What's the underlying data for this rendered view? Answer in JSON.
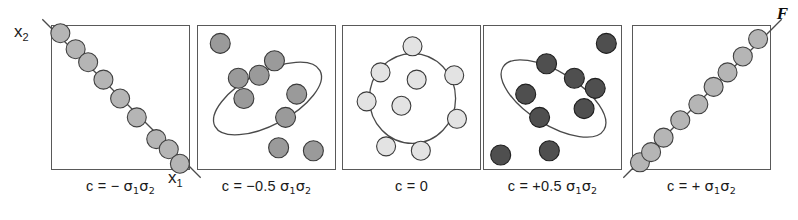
{
  "figure": {
    "tag": "F",
    "axis_x_label": "x",
    "axis_x_sub": "1",
    "axis_y_label": "x",
    "axis_y_sub": "2",
    "background_color": "#ffffff",
    "frame_color": "#595959"
  },
  "chart_data": {
    "type": "scatter",
    "title": "",
    "subtitle": "",
    "xlabel": "x1",
    "ylabel": "x2",
    "xlim": [
      0,
      1
    ],
    "ylim": [
      0,
      1
    ],
    "grid": false,
    "legend": null,
    "note": "Five scatter panels illustrating covariance c between two variables x1 and x2, from perfect negative correlation through zero to perfect positive correlation.",
    "panels": [
      {
        "id": "panel-neg-full",
        "caption": "c = − σ₁σ₂",
        "caption_parts": {
          "lhs": "c =",
          "sign": "−",
          "magnitude": "",
          "sigma": "σ₁σ₂"
        },
        "covariance": -1.0,
        "shape": "line",
        "shape_angle_deg": -45,
        "dot_fill": "#b5b5b5",
        "dot_stroke": "#404040",
        "dot_radius": 9.5,
        "points": [
          [
            0.06,
            0.95
          ],
          [
            0.17,
            0.84
          ],
          [
            0.26,
            0.75
          ],
          [
            0.37,
            0.63
          ],
          [
            0.49,
            0.5
          ],
          [
            0.61,
            0.37
          ],
          [
            0.75,
            0.22
          ],
          [
            0.84,
            0.15
          ],
          [
            0.92,
            0.05
          ]
        ]
      },
      {
        "id": "panel-neg-half",
        "caption": "c = − 0.5 σ₁σ₂",
        "caption_parts": {
          "lhs": "c =",
          "sign": "−",
          "magnitude": "0.5",
          "sigma": "σ₁σ₂"
        },
        "covariance": -0.5,
        "shape": "ellipse",
        "shape_angle_deg": -62,
        "ellipse_rx": 0.19,
        "ellipse_ry": 0.41,
        "dot_fill": "#9a9a9a",
        "dot_stroke": "#3a3a3a",
        "dot_radius": 10,
        "points": [
          [
            0.16,
            0.88
          ],
          [
            0.55,
            0.76
          ],
          [
            0.29,
            0.64
          ],
          [
            0.44,
            0.66
          ],
          [
            0.71,
            0.53
          ],
          [
            0.33,
            0.5
          ],
          [
            0.63,
            0.37
          ],
          [
            0.58,
            0.16
          ],
          [
            0.83,
            0.14
          ]
        ]
      },
      {
        "id": "panel-zero",
        "caption": "c = 0",
        "caption_parts": {
          "lhs": "c =",
          "sign": "",
          "magnitude": "0",
          "sigma": ""
        },
        "covariance": 0.0,
        "shape": "circle",
        "shape_angle_deg": 0,
        "ellipse_rx": 0.31,
        "ellipse_ry": 0.31,
        "dot_fill": "#e3e3e3",
        "dot_stroke": "#3a3a3a",
        "dot_radius": 9.5,
        "points": [
          [
            0.5,
            0.86
          ],
          [
            0.27,
            0.68
          ],
          [
            0.53,
            0.63
          ],
          [
            0.8,
            0.66
          ],
          [
            0.17,
            0.48
          ],
          [
            0.42,
            0.45
          ],
          [
            0.82,
            0.36
          ],
          [
            0.31,
            0.17
          ],
          [
            0.56,
            0.14
          ]
        ]
      },
      {
        "id": "panel-pos-half",
        "caption": "c = +0.5 σ₁σ₂",
        "caption_parts": {
          "lhs": "c =",
          "sign": "+",
          "magnitude": "0.5",
          "sigma": "σ₁σ₂"
        },
        "covariance": 0.5,
        "shape": "ellipse",
        "shape_angle_deg": 58,
        "ellipse_rx": 0.19,
        "ellipse_ry": 0.41,
        "dot_fill": "#4f4f4f",
        "dot_stroke": "#1f1f1f",
        "dot_radius": 10,
        "points": [
          [
            0.88,
            0.88
          ],
          [
            0.45,
            0.74
          ],
          [
            0.65,
            0.64
          ],
          [
            0.8,
            0.57
          ],
          [
            0.3,
            0.53
          ],
          [
            0.72,
            0.43
          ],
          [
            0.4,
            0.37
          ],
          [
            0.47,
            0.14
          ],
          [
            0.12,
            0.11
          ]
        ]
      },
      {
        "id": "panel-pos-full",
        "caption": "c = + σ₁σ₂",
        "caption_parts": {
          "lhs": "c =",
          "sign": "+",
          "magnitude": "",
          "sigma": "σ₁σ₂"
        },
        "covariance": 1.0,
        "shape": "line",
        "shape_angle_deg": 45,
        "dot_fill": "#b5b5b5",
        "dot_stroke": "#404040",
        "dot_radius": 9.5,
        "points": [
          [
            0.05,
            0.06
          ],
          [
            0.13,
            0.13
          ],
          [
            0.22,
            0.23
          ],
          [
            0.34,
            0.35
          ],
          [
            0.47,
            0.46
          ],
          [
            0.58,
            0.58
          ],
          [
            0.68,
            0.68
          ],
          [
            0.79,
            0.79
          ],
          [
            0.9,
            0.91
          ]
        ]
      }
    ]
  },
  "panel_positions": [
    51,
    197,
    342,
    483,
    632
  ]
}
